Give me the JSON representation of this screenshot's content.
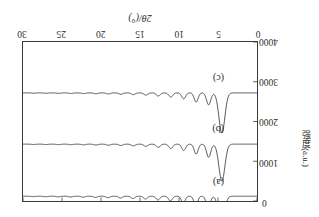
{
  "figure": {
    "orientation_note": "rotated-180",
    "panel_labels": [
      "(a)",
      "(b)",
      "(c)"
    ]
  },
  "chart_data": {
    "type": "line",
    "title": "",
    "xlabel": "2θ/(°)",
    "ylabel": "强度(a.u.)",
    "xlim": [
      0,
      30
    ],
    "ylim": [
      0,
      4000
    ],
    "xticks": [
      0,
      5,
      10,
      15,
      20,
      25,
      30
    ],
    "xtick_labels": [
      "0",
      "5",
      "10",
      "15",
      "20",
      "25",
      "30"
    ],
    "yticks": [
      0,
      1000,
      2000,
      3000,
      4000
    ],
    "ytick_labels": [
      "0",
      "1000",
      "2000",
      "3000",
      "4000"
    ],
    "grid": false,
    "legend_position": "none",
    "annotations": [
      {
        "text": "(a)",
        "x": 4.2,
        "y": 470
      },
      {
        "text": "(b)",
        "x": 4.2,
        "y": 1800
      },
      {
        "text": "(c)",
        "x": 4.2,
        "y": 3060
      }
    ],
    "series": [
      {
        "name": "(a)",
        "baseline": 120,
        "peaks": [
          {
            "x": 4.55,
            "height": 880,
            "width": 0.36
          },
          {
            "x": 6.25,
            "height": 300,
            "width": 0.26
          },
          {
            "x": 7.85,
            "height": 235,
            "width": 0.24
          },
          {
            "x": 9.45,
            "height": 175,
            "width": 0.24
          },
          {
            "x": 11.1,
            "height": 120,
            "width": 0.24
          },
          {
            "x": 12.7,
            "height": 95,
            "width": 0.24
          },
          {
            "x": 14.3,
            "height": 70,
            "width": 0.24
          },
          {
            "x": 15.9,
            "height": 58,
            "width": 0.24
          },
          {
            "x": 17.5,
            "height": 45,
            "width": 0.24
          },
          {
            "x": 19.1,
            "height": 38,
            "width": 0.24
          },
          {
            "x": 20.7,
            "height": 30,
            "width": 0.24
          },
          {
            "x": 22.3,
            "height": 24,
            "width": 0.24
          },
          {
            "x": 23.9,
            "height": 20,
            "width": 0.24
          },
          {
            "x": 25.5,
            "height": 16,
            "width": 0.24
          },
          {
            "x": 27.1,
            "height": 13,
            "width": 0.24
          },
          {
            "x": 28.7,
            "height": 11,
            "width": 0.24
          }
        ]
      },
      {
        "name": "(b)",
        "baseline": 1430,
        "peaks": [
          {
            "x": 4.5,
            "height": 930,
            "width": 0.38
          },
          {
            "x": 6.2,
            "height": 330,
            "width": 0.27
          },
          {
            "x": 7.8,
            "height": 250,
            "width": 0.25
          },
          {
            "x": 9.4,
            "height": 160,
            "width": 0.25
          },
          {
            "x": 11.05,
            "height": 110,
            "width": 0.25
          },
          {
            "x": 12.65,
            "height": 80,
            "width": 0.25
          },
          {
            "x": 14.25,
            "height": 55,
            "width": 0.25
          },
          {
            "x": 15.85,
            "height": 42,
            "width": 0.25
          },
          {
            "x": 17.45,
            "height": 34,
            "width": 0.25
          },
          {
            "x": 19.05,
            "height": 27,
            "width": 0.25
          },
          {
            "x": 20.65,
            "height": 22,
            "width": 0.25
          },
          {
            "x": 22.25,
            "height": 18,
            "width": 0.25
          },
          {
            "x": 23.85,
            "height": 14,
            "width": 0.25
          },
          {
            "x": 25.45,
            "height": 12,
            "width": 0.25
          },
          {
            "x": 27.05,
            "height": 10,
            "width": 0.25
          },
          {
            "x": 28.65,
            "height": 8,
            "width": 0.25
          }
        ]
      },
      {
        "name": "(c)",
        "baseline": 2720,
        "peaks": [
          {
            "x": 4.5,
            "height": 1010,
            "width": 0.38
          },
          {
            "x": 6.2,
            "height": 300,
            "width": 0.27
          },
          {
            "x": 7.8,
            "height": 230,
            "width": 0.25
          },
          {
            "x": 9.4,
            "height": 150,
            "width": 0.25
          },
          {
            "x": 11.05,
            "height": 105,
            "width": 0.25
          },
          {
            "x": 12.65,
            "height": 78,
            "width": 0.25
          },
          {
            "x": 14.25,
            "height": 55,
            "width": 0.25
          },
          {
            "x": 15.85,
            "height": 44,
            "width": 0.25
          },
          {
            "x": 17.45,
            "height": 34,
            "width": 0.25
          },
          {
            "x": 19.05,
            "height": 27,
            "width": 0.25
          },
          {
            "x": 20.65,
            "height": 22,
            "width": 0.25
          },
          {
            "x": 22.25,
            "height": 18,
            "width": 0.25
          },
          {
            "x": 23.85,
            "height": 15,
            "width": 0.25
          },
          {
            "x": 25.45,
            "height": 12,
            "width": 0.25
          },
          {
            "x": 27.05,
            "height": 10,
            "width": 0.25
          },
          {
            "x": 28.65,
            "height": 8,
            "width": 0.25
          }
        ]
      }
    ]
  },
  "colors": {
    "curve": "#1a1a1a",
    "axis": "#3a3a3a",
    "text": "#2b2b2b",
    "background": "#ffffff"
  }
}
